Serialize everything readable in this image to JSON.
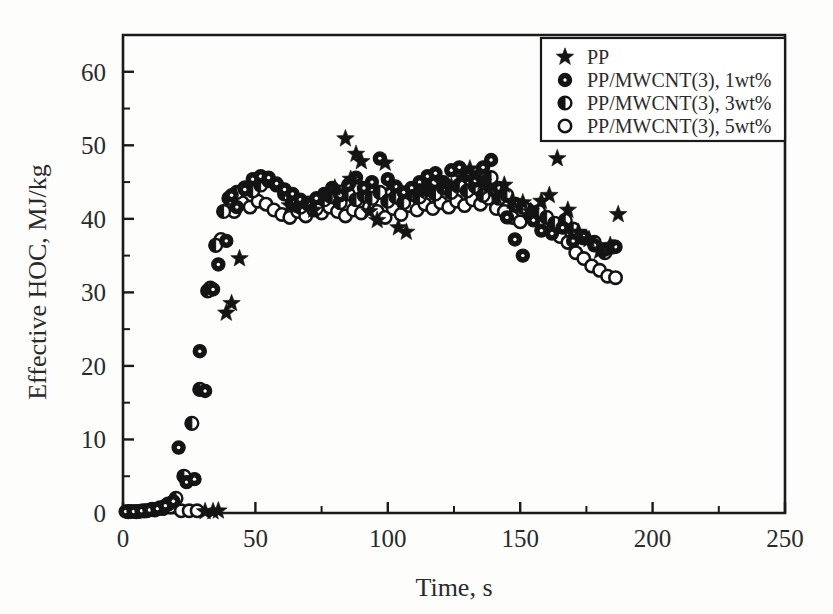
{
  "chart_data": {
    "type": "scatter",
    "title": "",
    "xlabel": "Time, s",
    "ylabel": "Effective HOC, MJ/kg",
    "xlim": [
      0,
      250
    ],
    "ylim": [
      0,
      65
    ],
    "xticks": [
      0,
      50,
      100,
      150,
      200,
      250
    ],
    "yticks": [
      0,
      10,
      20,
      30,
      40,
      50,
      60
    ],
    "xtick_labels": [
      "0",
      "50",
      "100",
      "150",
      "200",
      "250"
    ],
    "ytick_labels": [
      "0",
      "10",
      "20",
      "30",
      "40",
      "50",
      "60"
    ],
    "x_minor_step": 25,
    "y_minor_step": 5,
    "grid": false,
    "legend_position": "top-right",
    "series": [
      {
        "name": "PP",
        "marker": "star",
        "points": [
          [
            31,
            0.2
          ],
          [
            34,
            0.2
          ],
          [
            36,
            0.3
          ],
          [
            39,
            27.2
          ],
          [
            41,
            28.5
          ],
          [
            44,
            34.6
          ],
          [
            63,
            41.8
          ],
          [
            68,
            42.0
          ],
          [
            72,
            41.2
          ],
          [
            76,
            43.0
          ],
          [
            80,
            44.2
          ],
          [
            84,
            50.9
          ],
          [
            86,
            45.4
          ],
          [
            88,
            48.8
          ],
          [
            90,
            47.8
          ],
          [
            93,
            41.0
          ],
          [
            96,
            39.8
          ],
          [
            99,
            47.6
          ],
          [
            101,
            44.6
          ],
          [
            104,
            38.8
          ],
          [
            107,
            38.2
          ],
          [
            112,
            43.6
          ],
          [
            116,
            44.2
          ],
          [
            120,
            45.0
          ],
          [
            124,
            44.4
          ],
          [
            128,
            45.6
          ],
          [
            131,
            46.8
          ],
          [
            134,
            46.2
          ],
          [
            136,
            45.0
          ],
          [
            138,
            44.2
          ],
          [
            141,
            43.0
          ],
          [
            144,
            44.6
          ],
          [
            147,
            42.4
          ],
          [
            151,
            42.2
          ],
          [
            154,
            41.0
          ],
          [
            158,
            42.4
          ],
          [
            161,
            43.2
          ],
          [
            164,
            48.2
          ],
          [
            168,
            41.2
          ],
          [
            172,
            38.2
          ],
          [
            176,
            37.2
          ],
          [
            180,
            35.6
          ],
          [
            184,
            36.4
          ],
          [
            187,
            40.6
          ]
        ]
      },
      {
        "name": "PP/MWCNT(3), 1wt%",
        "marker": "circle-filled-dot",
        "points": [
          [
            1,
            0.2
          ],
          [
            4,
            0.2
          ],
          [
            7,
            0.3
          ],
          [
            10,
            0.4
          ],
          [
            13,
            0.6
          ],
          [
            16,
            1.0
          ],
          [
            19,
            1.6
          ],
          [
            21,
            8.9
          ],
          [
            24,
            4.2
          ],
          [
            27,
            4.6
          ],
          [
            29,
            22.0
          ],
          [
            31,
            16.6
          ],
          [
            34,
            30.4
          ],
          [
            36,
            33.8
          ],
          [
            39,
            37.0
          ],
          [
            41,
            43.2
          ],
          [
            43,
            41.6
          ],
          [
            46,
            44.0
          ],
          [
            49,
            45.4
          ],
          [
            52,
            45.8
          ],
          [
            55,
            45.6
          ],
          [
            58,
            44.8
          ],
          [
            61,
            44.0
          ],
          [
            64,
            43.4
          ],
          [
            67,
            42.6
          ],
          [
            70,
            42.2
          ],
          [
            73,
            42.8
          ],
          [
            76,
            43.4
          ],
          [
            79,
            44.2
          ],
          [
            82,
            43.2
          ],
          [
            85,
            44.6
          ],
          [
            88,
            45.6
          ],
          [
            91,
            44.2
          ],
          [
            94,
            45.0
          ],
          [
            97,
            48.2
          ],
          [
            100,
            45.4
          ],
          [
            103,
            44.4
          ],
          [
            106,
            43.6
          ],
          [
            109,
            44.2
          ],
          [
            112,
            45.0
          ],
          [
            115,
            45.8
          ],
          [
            118,
            46.2
          ],
          [
            121,
            45.0
          ],
          [
            124,
            46.6
          ],
          [
            127,
            47.0
          ],
          [
            130,
            46.0
          ],
          [
            133,
            45.2
          ],
          [
            136,
            47.0
          ],
          [
            139,
            48.0
          ],
          [
            142,
            44.2
          ],
          [
            145,
            40.2
          ],
          [
            148,
            37.2
          ],
          [
            151,
            35.0
          ],
          [
            155,
            39.8
          ],
          [
            158,
            38.4
          ],
          [
            162,
            38.0
          ],
          [
            166,
            38.8
          ],
          [
            170,
            37.0
          ],
          [
            174,
            37.6
          ],
          [
            178,
            36.4
          ],
          [
            182,
            35.8
          ],
          [
            186,
            36.2
          ]
        ]
      },
      {
        "name": "PP/MWCNT(3), 3wt%",
        "marker": "circle-half",
        "points": [
          [
            2,
            0.2
          ],
          [
            5,
            0.2
          ],
          [
            8,
            0.3
          ],
          [
            11,
            0.5
          ],
          [
            14,
            0.7
          ],
          [
            17,
            1.2
          ],
          [
            20,
            2.0
          ],
          [
            23,
            5.0
          ],
          [
            26,
            12.2
          ],
          [
            29,
            16.8
          ],
          [
            32,
            30.2
          ],
          [
            35,
            36.4
          ],
          [
            38,
            41.0
          ],
          [
            40,
            42.8
          ],
          [
            43,
            43.6
          ],
          [
            46,
            44.2
          ],
          [
            49,
            43.8
          ],
          [
            52,
            44.6
          ],
          [
            55,
            45.2
          ],
          [
            58,
            44.6
          ],
          [
            61,
            43.4
          ],
          [
            64,
            42.2
          ],
          [
            67,
            41.6
          ],
          [
            70,
            42.0
          ],
          [
            73,
            41.4
          ],
          [
            76,
            42.6
          ],
          [
            79,
            43.0
          ],
          [
            82,
            42.2
          ],
          [
            85,
            43.4
          ],
          [
            88,
            42.6
          ],
          [
            91,
            43.2
          ],
          [
            94,
            42.8
          ],
          [
            97,
            43.6
          ],
          [
            100,
            42.4
          ],
          [
            103,
            43.0
          ],
          [
            106,
            42.2
          ],
          [
            109,
            43.4
          ],
          [
            112,
            43.0
          ],
          [
            115,
            44.0
          ],
          [
            118,
            43.4
          ],
          [
            121,
            44.2
          ],
          [
            124,
            43.6
          ],
          [
            127,
            44.6
          ],
          [
            130,
            43.8
          ],
          [
            133,
            44.4
          ],
          [
            136,
            43.2
          ],
          [
            139,
            45.6
          ],
          [
            142,
            42.8
          ],
          [
            145,
            43.2
          ],
          [
            148,
            42.0
          ],
          [
            151,
            41.6
          ],
          [
            154,
            40.4
          ],
          [
            157,
            41.0
          ],
          [
            160,
            40.2
          ],
          [
            163,
            39.4
          ],
          [
            167,
            39.8
          ],
          [
            170,
            38.6
          ],
          [
            174,
            37.4
          ],
          [
            178,
            36.8
          ],
          [
            182,
            35.4
          ],
          [
            185,
            36.2
          ]
        ]
      },
      {
        "name": "PP/MWCNT(3), 5wt%",
        "marker": "circle-open",
        "points": [
          [
            3,
            0.2
          ],
          [
            6,
            0.2
          ],
          [
            9,
            0.3
          ],
          [
            12,
            0.4
          ],
          [
            15,
            0.6
          ],
          [
            18,
            0.8
          ],
          [
            22,
            0.3
          ],
          [
            25,
            0.3
          ],
          [
            28,
            0.3
          ],
          [
            33,
            30.6
          ],
          [
            37,
            37.2
          ],
          [
            42,
            41.0
          ],
          [
            45,
            42.2
          ],
          [
            48,
            41.6
          ],
          [
            51,
            42.4
          ],
          [
            54,
            42.0
          ],
          [
            57,
            41.2
          ],
          [
            60,
            40.6
          ],
          [
            63,
            40.2
          ],
          [
            66,
            41.0
          ],
          [
            69,
            40.4
          ],
          [
            72,
            41.2
          ],
          [
            75,
            40.8
          ],
          [
            78,
            41.6
          ],
          [
            81,
            41.0
          ],
          [
            84,
            40.4
          ],
          [
            87,
            41.2
          ],
          [
            90,
            40.8
          ],
          [
            93,
            41.6
          ],
          [
            96,
            41.0
          ],
          [
            99,
            40.2
          ],
          [
            102,
            41.4
          ],
          [
            105,
            40.6
          ],
          [
            108,
            41.8
          ],
          [
            111,
            41.2
          ],
          [
            114,
            42.0
          ],
          [
            117,
            41.4
          ],
          [
            120,
            42.2
          ],
          [
            123,
            41.6
          ],
          [
            126,
            42.4
          ],
          [
            129,
            41.8
          ],
          [
            132,
            42.6
          ],
          [
            135,
            42.0
          ],
          [
            138,
            42.8
          ],
          [
            141,
            41.4
          ],
          [
            144,
            41.0
          ],
          [
            147,
            40.2
          ],
          [
            150,
            39.6
          ],
          [
            153,
            41.2
          ],
          [
            156,
            40.0
          ],
          [
            159,
            39.2
          ],
          [
            162,
            38.4
          ],
          [
            165,
            37.6
          ],
          [
            168,
            36.8
          ],
          [
            171,
            35.4
          ],
          [
            174,
            34.6
          ],
          [
            177,
            33.6
          ],
          [
            180,
            33.0
          ],
          [
            183,
            32.2
          ],
          [
            186,
            32.0
          ]
        ]
      }
    ]
  },
  "legend": {
    "entries": [
      {
        "label": "PP",
        "marker": "star"
      },
      {
        "label": "PP/MWCNT(3), 1wt%",
        "marker": "circle-filled-dot"
      },
      {
        "label": "PP/MWCNT(3), 3wt%",
        "marker": "circle-half"
      },
      {
        "label": "PP/MWCNT(3), 5wt%",
        "marker": "circle-open"
      }
    ]
  },
  "colors": {
    "marker": "#141414",
    "axis": "#1a1a1a",
    "background": "#fdfdfc",
    "text": "#2a2a2a"
  }
}
